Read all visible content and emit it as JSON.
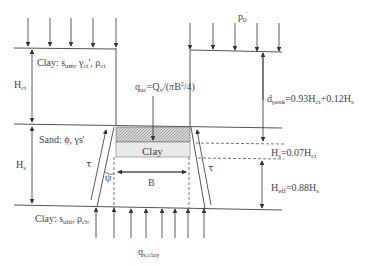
{
  "diagram": {
    "type": "geotechnical cross-section: clay plug uplift through sand layer",
    "layers": {
      "top_clay": {
        "label": "Clay: ",
        "s": "s",
        "s_sub": "um",
        "gamma": "γ",
        "gamma_sub": "ct",
        "gamma_sup": "'",
        "rho": "ρ",
        "rho_sub": "ct"
      },
      "sand": {
        "label": "Sand: ϕ, γs'"
      },
      "plug": {
        "label": "Clay"
      },
      "bottom_clay": {
        "label": "Clay: ",
        "s": "s",
        "s_sub": "uhi",
        "rho": "ρ",
        "rho_sub": "cb"
      }
    },
    "dimensions": {
      "H_ct": {
        "main": "H",
        "sub": "ct"
      },
      "H_s": {
        "main": "H",
        "sub": "s"
      },
      "B": "B",
      "d_peak": {
        "main": "d",
        "sub": "peak",
        "rest": "=0.93H",
        "rest_sub": "ct",
        "rest2": "+0.12H",
        "rest2_sub": "s"
      },
      "H_g": {
        "main": "H",
        "sub": "s",
        "rest": "=0.07H",
        "rest_sub": "ct"
      },
      "H_eff": {
        "main": "H",
        "sub": "eff",
        "rest": "=0.88H",
        "rest_sub": "s"
      }
    },
    "loads": {
      "p0": {
        "main": "p",
        "sub": "0",
        "sup": "'"
      },
      "q_uc": {
        "main": "q",
        "sub": "uc",
        "rest": "=Q",
        "rest_sub": "v",
        "rest2": "/(πB",
        "rest2_sup": "2",
        "rest3": "/4)"
      },
      "q_v_clay": {
        "main": "q",
        "sub": "v,clay"
      }
    },
    "symbols": {
      "tau_left": "τ",
      "tau_right": "τ",
      "psi": "ψ"
    }
  }
}
